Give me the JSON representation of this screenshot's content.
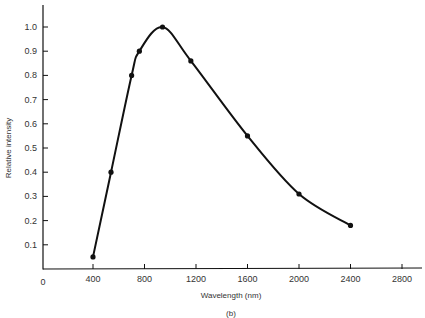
{
  "chart_data": {
    "type": "line",
    "title": "",
    "caption": "(b)",
    "xlabel": "Wavelength (nm)",
    "ylabel": "Relative intensity",
    "xlim": [
      0,
      3000
    ],
    "ylim": [
      0,
      1.1
    ],
    "x_ticks": [
      400,
      800,
      1200,
      1600,
      2000,
      2400,
      2800
    ],
    "x_tick_labels": [
      "0",
      "400",
      "800",
      "1200",
      "1600",
      "2000",
      "2400",
      "2800"
    ],
    "y_ticks": [
      0.1,
      0.2,
      0.3,
      0.4,
      0.5,
      0.6,
      0.7,
      0.8,
      0.9,
      1.0
    ],
    "y_tick_labels": [
      "0.1",
      "0.2",
      "0.3",
      "0.4",
      "0.5",
      "0.6",
      "0.7",
      "0.8",
      "0.9",
      "1.0"
    ],
    "grid": false,
    "legend": null,
    "series": [
      {
        "name": "Relative intensity",
        "x": [
          400,
          540,
          700,
          760,
          940,
          1160,
          1600,
          2000,
          2400
        ],
        "y": [
          0.05,
          0.4,
          0.8,
          0.9,
          1.0,
          0.86,
          0.55,
          0.31,
          0.18
        ],
        "marker": "filled-circle",
        "line": "smooth"
      }
    ]
  },
  "labels": {
    "xlabel": "Wavelength (nm)",
    "ylabel": "Relative intensity",
    "caption": "(b)",
    "origin": "0"
  }
}
